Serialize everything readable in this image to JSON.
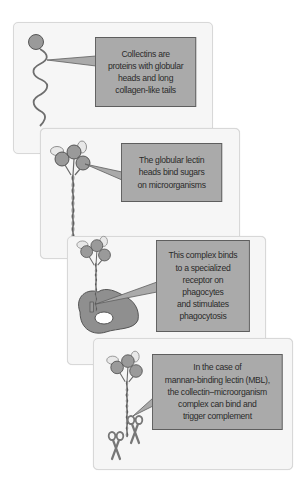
{
  "figure": {
    "colors": {
      "panel_background": "#f6f6f6",
      "panel_border": "#d8d8d8",
      "callout_fill": "#aaaaaa",
      "callout_border": "#5e5e5e",
      "molecule_fill": "#9a9a9a",
      "molecule_stroke": "#4a4a4a",
      "sugar_fill": "#e8e8e8",
      "cell_fill": "#8f8f8f",
      "nucleus_fill": "#ffffff",
      "text_color": "#2b2b2b"
    },
    "panels": [
      {
        "id": 1,
        "illustration": "single collectin with globular head and wavy collagen-like tail",
        "text": "Collectins are\nproteins with globular\nheads and long\ncollagen-like tails"
      },
      {
        "id": 2,
        "illustration": "trimeric collectin with lectin heads binding sugar residues",
        "text": "The globular lectin\nheads bind sugars\non microorganisms"
      },
      {
        "id": 3,
        "illustration": "collectin bound to receptor on a phagocyte cell",
        "text": "This complex binds\nto a specialized\nreceptor on\nphagocytes\nand stimulates\nphagocytosis"
      },
      {
        "id": 4,
        "illustration": "collectin with associated MASP serine proteases (scissors)",
        "text": "In the case of\nmannan-binding lectin (MBL),\nthe collectin–microorganism\ncomplex can bind and\ntrigger complement"
      }
    ]
  }
}
